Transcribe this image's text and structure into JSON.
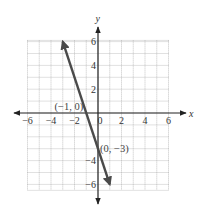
{
  "chart_data": {
    "type": "line",
    "title": "",
    "equation": "y = -3x - 3",
    "xlabel": "x",
    "ylabel": "y",
    "xlim": [
      -6,
      6
    ],
    "ylim": [
      -6,
      6
    ],
    "grid": true,
    "x_ticks": [
      -6,
      -4,
      -2,
      0,
      2,
      4,
      6
    ],
    "y_ticks": [
      -6,
      -4,
      2,
      4,
      6
    ],
    "x_tick_labels": [
      "−6",
      "−4",
      "−2",
      "0",
      "2",
      "4",
      "6"
    ],
    "y_tick_labels": [
      "−6",
      "−4",
      "2",
      "4",
      "6"
    ],
    "series": [
      {
        "name": "line",
        "x": [
          -3,
          1
        ],
        "y": [
          6,
          -6
        ],
        "color": "#4a4a4a",
        "arrows": "both"
      }
    ],
    "annotations": [
      {
        "label": "(−1, 0)",
        "x": -1,
        "y": 0
      },
      {
        "label": "(0, −3)",
        "x": 0,
        "y": -3
      }
    ]
  },
  "colors": {
    "axis": "#222222",
    "grid": "#9a9a9a",
    "line": "#4a4a4a"
  }
}
